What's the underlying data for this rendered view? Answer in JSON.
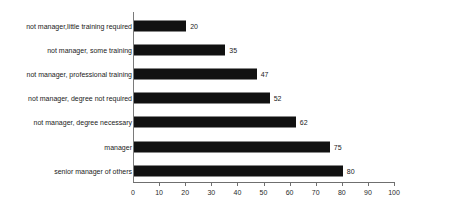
{
  "chart_data": {
    "type": "bar",
    "orientation": "horizontal",
    "title": "",
    "subtitle": "",
    "xlabel": "",
    "ylabel": "",
    "xlim": [
      0,
      100
    ],
    "grid": false,
    "legend": false,
    "bar_color": "#111111",
    "axis_color": "#6f6f6f",
    "categories": [
      "not manager,little training required",
      "not manager, some training",
      "not manager, professional training",
      "not manager, degree not required",
      "not manager, degree necessary",
      "manager",
      "senior manager of others"
    ],
    "values": [
      20,
      35,
      47,
      52,
      62,
      75,
      80
    ],
    "value_labels": [
      "20",
      "35",
      "47",
      "52",
      "62",
      "75",
      "80"
    ],
    "xticks": [
      0,
      10,
      20,
      30,
      40,
      50,
      60,
      70,
      80,
      90,
      100
    ],
    "xtick_labels": [
      "0",
      "10",
      "20",
      "30",
      "40",
      "50",
      "60",
      "70",
      "80",
      "90",
      "100"
    ]
  }
}
